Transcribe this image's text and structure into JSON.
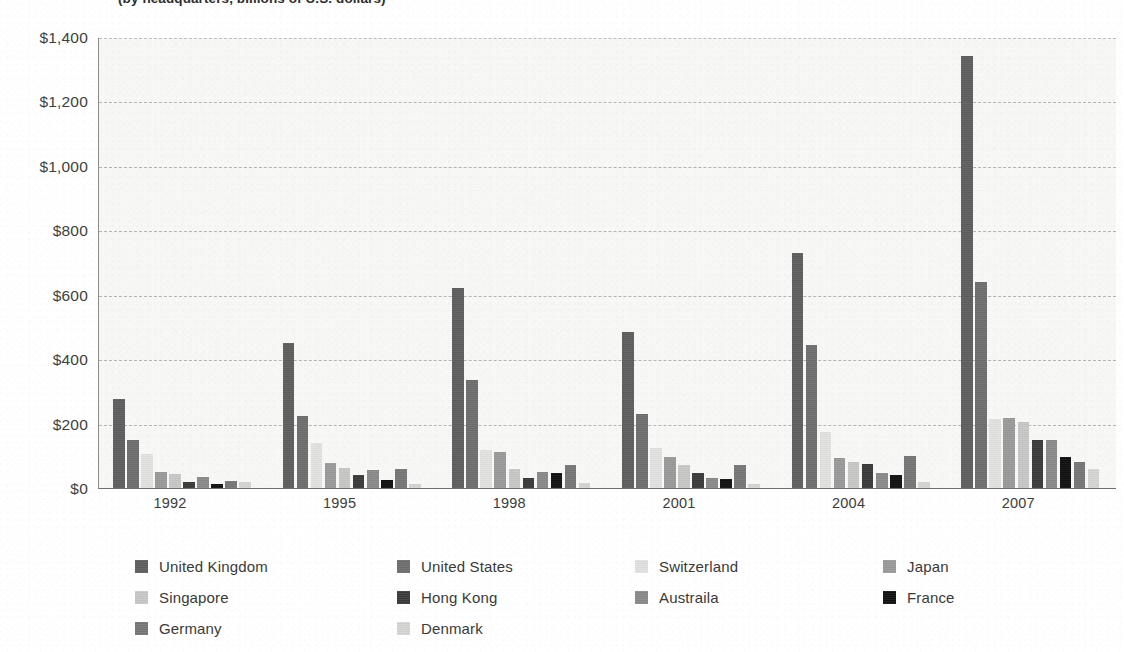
{
  "title": "(by headquarters, billions of U.S. dollars)",
  "legend": {
    "position": "bottom",
    "columns": 4,
    "items": [
      {
        "label": "United Kingdom",
        "color": "#5e5e5e",
        "swatch_name": "legend-swatch-united-kingdom"
      },
      {
        "label": "United States",
        "color": "#6e6e6e",
        "swatch_name": "legend-swatch-united-states"
      },
      {
        "label": "Switzerland",
        "color": "#e2e2e0",
        "swatch_name": "legend-swatch-switzerland"
      },
      {
        "label": "Japan",
        "color": "#9a9a9a",
        "swatch_name": "legend-swatch-japan"
      },
      {
        "label": "Singapore",
        "color": "#c8c8c6",
        "swatch_name": "legend-swatch-singapore"
      },
      {
        "label": "Hong Kong",
        "color": "#3a3a3a",
        "swatch_name": "legend-swatch-hong-kong"
      },
      {
        "label": "Austraila",
        "color": "#8a8a8a",
        "swatch_name": "legend-swatch-austraila"
      },
      {
        "label": "France",
        "color": "#101010",
        "swatch_name": "legend-swatch-france"
      },
      {
        "label": "Germany",
        "color": "#767676",
        "swatch_name": "legend-swatch-germany"
      },
      {
        "label": "Denmark",
        "color": "#d6d6d4",
        "swatch_name": "legend-swatch-denmark"
      }
    ]
  },
  "chart_data": {
    "type": "bar",
    "title": "(by headquarters, billions of U.S. dollars)",
    "xlabel": "",
    "ylabel": "",
    "ylim": [
      0,
      1400
    ],
    "ytick_step": 200,
    "ytick_labels": [
      "$0",
      "$200",
      "$400",
      "$600",
      "$800",
      "$1,000",
      "$1,200",
      "$1,400"
    ],
    "ytick_values": [
      0,
      200,
      400,
      600,
      800,
      1000,
      1200,
      1400
    ],
    "grid": true,
    "grid_style": "dashed-horizontal",
    "legend_position": "bottom",
    "categories": [
      1991,
      1994,
      1997,
      2000,
      2003,
      2006
    ],
    "xtick_labels": [
      "1992",
      "1995",
      "1998",
      "2001",
      "2004",
      "2007"
    ],
    "xtick_values": [
      1992,
      1995,
      1998,
      2001,
      2004,
      2007
    ],
    "series": [
      {
        "name": "United Kingdom",
        "color": "#5e5e5e",
        "values": [
          275,
          450,
          620,
          485,
          730,
          1340
        ]
      },
      {
        "name": "United States",
        "color": "#6e6e6e",
        "values": [
          150,
          225,
          335,
          230,
          445,
          640
        ]
      },
      {
        "name": "Switzerland",
        "color": "#e2e2e0",
        "values": [
          105,
          140,
          118,
          125,
          175,
          215
        ]
      },
      {
        "name": "Japan",
        "color": "#9a9a9a",
        "values": [
          50,
          78,
          112,
          95,
          92,
          218
        ]
      },
      {
        "name": "Singapore",
        "color": "#c8c8c6",
        "values": [
          42,
          62,
          58,
          70,
          80,
          205
        ]
      },
      {
        "name": "Hong Kong",
        "color": "#3a3a3a",
        "values": [
          18,
          40,
          32,
          48,
          75,
          150
        ]
      },
      {
        "name": "Austraila",
        "color": "#8a8a8a",
        "values": [
          35,
          55,
          50,
          32,
          48,
          148
        ]
      },
      {
        "name": "France",
        "color": "#101010",
        "values": [
          14,
          25,
          48,
          28,
          40,
          95
        ]
      },
      {
        "name": "Germany",
        "color": "#767676",
        "values": [
          22,
          58,
          72,
          72,
          98,
          82
        ]
      },
      {
        "name": "Denmark",
        "color": "#d6d6d4",
        "values": [
          20,
          14,
          15,
          12,
          20,
          60
        ]
      }
    ]
  }
}
